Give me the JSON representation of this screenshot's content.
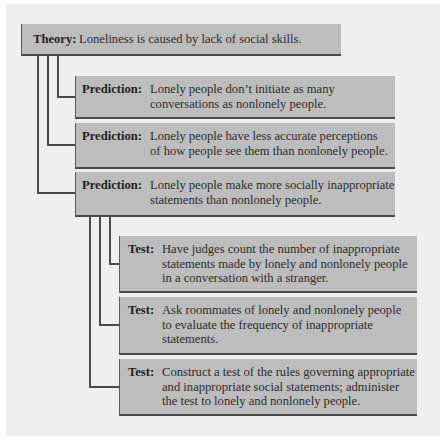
{
  "theory": {
    "label": "Theory:",
    "text": "Loneliness is caused by lack of social skills."
  },
  "predictions": [
    {
      "label": "Prediction:",
      "lines": [
        "Lonely people don’t initiate as many",
        "conversations as nonlonely people."
      ]
    },
    {
      "label": "Prediction:",
      "lines": [
        "Lonely people have less accurate perceptions",
        "of how people see them than nonlonely people."
      ]
    },
    {
      "label": "Prediction:",
      "lines": [
        "Lonely people make more socially inappropriate",
        "statements than nonlonely people."
      ]
    }
  ],
  "tests": [
    {
      "label": "Test:",
      "lines": [
        "Have judges count the number of inappropriate",
        "statements made by lonely and nonlonely people",
        "in a conversation with a stranger."
      ]
    },
    {
      "label": "Test:",
      "lines": [
        "Ask roommates of lonely and nonlonely people",
        "to evaluate the frequency of inappropriate",
        "statements."
      ]
    },
    {
      "label": "Test:",
      "lines": [
        "Construct a test of the rules governing appropriate",
        "and inappropriate social statements; administer",
        "the test to lonely and nonlonely people."
      ]
    }
  ],
  "colors": {
    "box_fill": "#bdbdbd",
    "box_border": "#4a4a4a",
    "panel": "#efefef",
    "text": "#2a2a2a"
  }
}
